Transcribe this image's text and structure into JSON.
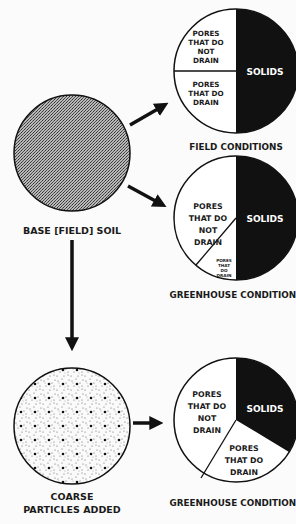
{
  "diagram": {
    "colors": {
      "solids": "#111111",
      "pores": "#ffffff",
      "outline": "#111111",
      "background": "#fbfbfb"
    },
    "base_soil": {
      "label": "BASE [FIELD] SOIL",
      "texture": "fine-stipple"
    },
    "amended_soil": {
      "label_line1": "COARSE",
      "label_line2": "PARTICLES ADDED",
      "texture": "coarse-dots"
    },
    "pies": [
      {
        "caption": "FIELD CONDITIONS",
        "slices": {
          "solids": {
            "label": "SOLIDS",
            "fraction": 0.5
          },
          "no_drain": {
            "lines": [
              "PORES",
              "THAT DO",
              "NOT",
              "DRAIN"
            ],
            "fraction": 0.25
          },
          "drain": {
            "lines": [
              "PORES",
              "THAT DO",
              "DRAIN"
            ],
            "fraction": 0.25
          }
        }
      },
      {
        "caption": "GREENHOUSE CONDITIONS",
        "slices": {
          "solids": {
            "label": "SOLIDS",
            "fraction": 0.5
          },
          "no_drain": {
            "lines": [
              "PORES",
              "THAT DO",
              "NOT",
              "DRAIN"
            ],
            "fraction": 0.44
          },
          "drain": {
            "lines": [
              "PORES",
              "THAT",
              "DO",
              "DRAIN"
            ],
            "fraction": 0.06
          }
        }
      },
      {
        "caption": "GREENHOUSE CONDITIONS",
        "slices": {
          "solids": {
            "label": "SOLIDS",
            "fraction": 0.33
          },
          "no_drain": {
            "lines": [
              "PORES",
              "THAT DO",
              "NOT",
              "DRAIN"
            ],
            "fraction": 0.45
          },
          "drain": {
            "lines": [
              "PORES",
              "THAT DO",
              "DRAIN"
            ],
            "fraction": 0.22
          }
        }
      }
    ]
  }
}
